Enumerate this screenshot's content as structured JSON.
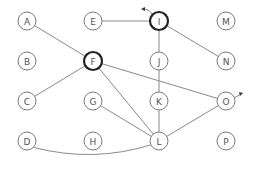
{
  "diagram": {
    "type": "graph",
    "nodes": [
      {
        "id": "A",
        "x": 27,
        "y": 21,
        "highlight": false
      },
      {
        "id": "E",
        "x": 93,
        "y": 21,
        "highlight": false
      },
      {
        "id": "I",
        "x": 159,
        "y": 21,
        "highlight": true
      },
      {
        "id": "M",
        "x": 226,
        "y": 21,
        "highlight": false
      },
      {
        "id": "B",
        "x": 27,
        "y": 61,
        "highlight": false
      },
      {
        "id": "F",
        "x": 93,
        "y": 61,
        "highlight": true
      },
      {
        "id": "J",
        "x": 159,
        "y": 61,
        "highlight": false
      },
      {
        "id": "N",
        "x": 226,
        "y": 61,
        "highlight": false
      },
      {
        "id": "C",
        "x": 27,
        "y": 101,
        "highlight": false
      },
      {
        "id": "G",
        "x": 93,
        "y": 101,
        "highlight": false
      },
      {
        "id": "K",
        "x": 159,
        "y": 101,
        "highlight": false
      },
      {
        "id": "O",
        "x": 226,
        "y": 101,
        "highlight": false
      },
      {
        "id": "D",
        "x": 27,
        "y": 141,
        "highlight": false
      },
      {
        "id": "H",
        "x": 93,
        "y": 141,
        "highlight": false
      },
      {
        "id": "L",
        "x": 159,
        "y": 141,
        "highlight": false
      },
      {
        "id": "P",
        "x": 226,
        "y": 141,
        "highlight": false
      }
    ],
    "edges": [
      {
        "from": "A",
        "to": "F"
      },
      {
        "from": "E",
        "to": "I"
      },
      {
        "from": "I",
        "to": "N"
      },
      {
        "from": "I",
        "to": "L"
      },
      {
        "from": "F",
        "to": "C"
      },
      {
        "from": "F",
        "to": "L"
      },
      {
        "from": "F",
        "to": "O"
      },
      {
        "from": "G",
        "to": "L"
      },
      {
        "from": "L",
        "to": "O"
      },
      {
        "from": "D",
        "to": "L",
        "curved": true
      }
    ],
    "arrows": [
      {
        "at": "I",
        "direction": "up-left"
      },
      {
        "at": "O",
        "direction": "up-right"
      }
    ],
    "colors": {
      "edge": "#8a8a8a",
      "node_stroke": "#7a7a7a",
      "highlight_stroke": "#222222",
      "label": "#555555"
    }
  }
}
